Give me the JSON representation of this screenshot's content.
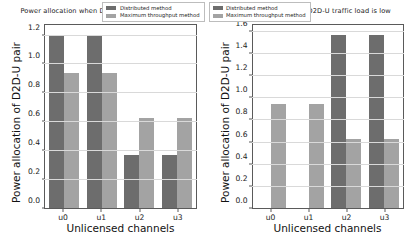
{
  "figure": {
    "panels": [
      "high",
      "low"
    ]
  },
  "colors": {
    "distributed": "#6d6d6d",
    "maximum_throughput": "#a3a3a3",
    "axis": "#5a5a5a",
    "grid": "#d9d9d9",
    "background": "#ffffff",
    "text": "#1a1a1a"
  },
  "chart_data": [
    {
      "type": "bar",
      "title": "Power allocation when D2D-U traffic load is high",
      "xlabel": "Unlicensed channels",
      "ylabel": "Power allocation of D2D-U pair",
      "categories": [
        "u0",
        "u1",
        "u2",
        "u3"
      ],
      "series": [
        {
          "name": "Distributed method",
          "values": [
            1.21,
            1.21,
            0.37,
            0.37
          ],
          "color": "#6d6d6d"
        },
        {
          "name": "Maximum throughput method",
          "values": [
            0.945,
            0.945,
            0.63,
            0.63
          ],
          "color": "#a3a3a3"
        }
      ],
      "ylim": [
        0.0,
        1.28
      ],
      "yticks": [
        0.0,
        0.2,
        0.4,
        0.6,
        0.8,
        1.0,
        1.2
      ],
      "ytick_labels": [
        "0.0",
        "0.2",
        "0.4",
        "0.6",
        "0.8",
        "1.0",
        "1.2"
      ],
      "grid": true,
      "legend_position": "upper right"
    },
    {
      "type": "bar",
      "title": "Power allocation when D2D-U traffic load is low",
      "xlabel": "Unlicensed channels",
      "ylabel": "Power allocation of D2D-U pair",
      "categories": [
        "u0",
        "u1",
        "u2",
        "u3"
      ],
      "series": [
        {
          "name": "Distributed method",
          "values": [
            0.0,
            0.0,
            1.58,
            1.58
          ],
          "color": "#6d6d6d"
        },
        {
          "name": "Maximum throughput method",
          "values": [
            0.945,
            0.945,
            0.63,
            0.63
          ],
          "color": "#a3a3a3"
        }
      ],
      "ylim": [
        0.0,
        1.67
      ],
      "yticks": [
        0.0,
        0.2,
        0.4,
        0.6,
        0.8,
        1.0,
        1.2,
        1.4,
        1.6
      ],
      "ytick_labels": [
        "0.0",
        "0.2",
        "0.4",
        "0.6",
        "0.8",
        "1.0",
        "1.2",
        "1.4",
        "1.6"
      ],
      "grid": true,
      "legend_position": "upper left"
    }
  ]
}
